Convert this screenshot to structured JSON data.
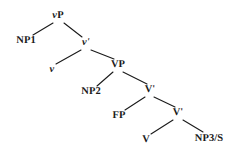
{
  "figure": {
    "type": "syntax-tree",
    "background_color": "#ffffff",
    "line_color": "#1a1a1a",
    "text_color": "#1a1a1a"
  },
  "nodes": [
    {
      "id": "vp",
      "label": "vP",
      "x": 58,
      "y": 16,
      "style": "italic-initial",
      "role": "root"
    },
    {
      "id": "np1",
      "label": "NP1",
      "x": 26,
      "y": 41,
      "style": "plain",
      "role": "terminal"
    },
    {
      "id": "vbar",
      "label": "v'",
      "x": 86,
      "y": 43,
      "style": "italic",
      "role": "branch"
    },
    {
      "id": "v_low",
      "label": "v",
      "x": 52,
      "y": 70,
      "style": "italic",
      "role": "terminal"
    },
    {
      "id": "vp2",
      "label": "VP",
      "x": 118,
      "y": 65,
      "style": "plain",
      "role": "branch"
    },
    {
      "id": "np2",
      "label": "NP2",
      "x": 91,
      "y": 92,
      "style": "plain",
      "role": "terminal"
    },
    {
      "id": "Vbar1",
      "label": "V'",
      "x": 150,
      "y": 90,
      "style": "plain",
      "role": "branch"
    },
    {
      "id": "fp",
      "label": "FP",
      "x": 119,
      "y": 116,
      "style": "plain",
      "role": "terminal"
    },
    {
      "id": "Vbar2",
      "label": "V'",
      "x": 178,
      "y": 113,
      "style": "plain",
      "role": "branch"
    },
    {
      "id": "v_term",
      "label": "V",
      "x": 146,
      "y": 140,
      "style": "plain",
      "role": "terminal"
    },
    {
      "id": "np3s",
      "label": "NP3/S",
      "x": 209,
      "y": 139,
      "style": "plain",
      "role": "terminal"
    }
  ],
  "edges": [
    {
      "from": "vp",
      "to": "np1",
      "x1": 53,
      "y1": 23,
      "x2": 33,
      "y2": 35
    },
    {
      "from": "vp",
      "to": "vbar",
      "x1": 64,
      "y1": 23,
      "x2": 82,
      "y2": 37
    },
    {
      "from": "vbar",
      "to": "v_low",
      "x1": 81,
      "y1": 50,
      "x2": 56,
      "y2": 64
    },
    {
      "from": "vbar",
      "to": "vp2",
      "x1": 91,
      "y1": 50,
      "x2": 114,
      "y2": 59
    },
    {
      "from": "vp2",
      "to": "np2",
      "x1": 113,
      "y1": 72,
      "x2": 97,
      "y2": 86
    },
    {
      "from": "vp2",
      "to": "Vbar1",
      "x1": 123,
      "y1": 72,
      "x2": 147,
      "y2": 84
    },
    {
      "from": "Vbar1",
      "to": "fp",
      "x1": 145,
      "y1": 97,
      "x2": 125,
      "y2": 110
    },
    {
      "from": "Vbar1",
      "to": "Vbar2",
      "x1": 154,
      "y1": 97,
      "x2": 175,
      "y2": 107
    },
    {
      "from": "Vbar2",
      "to": "v_term",
      "x1": 173,
      "y1": 120,
      "x2": 151,
      "y2": 134
    },
    {
      "from": "Vbar2",
      "to": "np3s",
      "x1": 183,
      "y1": 120,
      "x2": 203,
      "y2": 132
    }
  ]
}
